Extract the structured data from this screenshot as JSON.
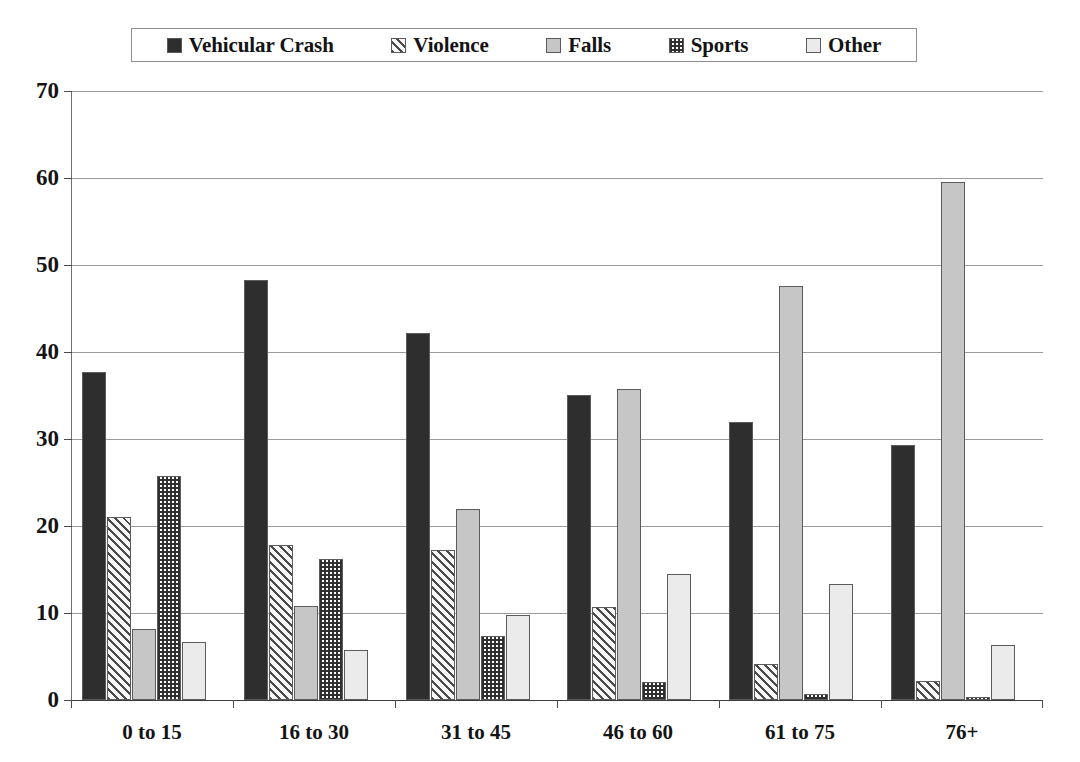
{
  "chart_data": {
    "type": "bar",
    "title": "",
    "subtitle": "",
    "xlabel": "",
    "ylabel": "",
    "ylim": [
      0,
      70
    ],
    "yticks": [
      0,
      10,
      20,
      30,
      40,
      50,
      60,
      70
    ],
    "grid": true,
    "legend_position": "top",
    "categories": [
      "0 to 15",
      "16 to 30",
      "31 to 45",
      "46 to 60",
      "61 to 75",
      "76+"
    ],
    "series": [
      {
        "name": "Vehicular Crash",
        "pattern": "solid-dark",
        "color": "#2e2e2e",
        "values": [
          37.7,
          48.3,
          42.2,
          35.1,
          32.0,
          29.3
        ]
      },
      {
        "name": "Violence",
        "pattern": "diagonal-hatch",
        "color": "#4a4a4a",
        "values": [
          21.0,
          17.8,
          17.2,
          10.7,
          4.1,
          2.2
        ]
      },
      {
        "name": "Falls",
        "pattern": "solid-gray",
        "color": "#c6c6c6",
        "values": [
          8.2,
          10.8,
          21.9,
          35.7,
          47.6,
          59.5
        ]
      },
      {
        "name": "Sports",
        "pattern": "checkerboard",
        "color": "#2f2f2f",
        "values": [
          25.7,
          16.2,
          7.4,
          2.1,
          0.7,
          0.3
        ]
      },
      {
        "name": "Other",
        "pattern": "solid-light",
        "color": "#ebebeb",
        "values": [
          6.7,
          5.8,
          9.8,
          14.5,
          13.3,
          6.3
        ]
      }
    ]
  },
  "legend": {
    "entries": [
      {
        "label": "Vehicular Crash",
        "swatch": "fill-vehicular"
      },
      {
        "label": "Violence",
        "swatch": "fill-violence"
      },
      {
        "label": "Falls",
        "swatch": "fill-falls"
      },
      {
        "label": "Sports",
        "swatch": "fill-sports"
      },
      {
        "label": "Other",
        "swatch": "fill-other"
      }
    ]
  }
}
